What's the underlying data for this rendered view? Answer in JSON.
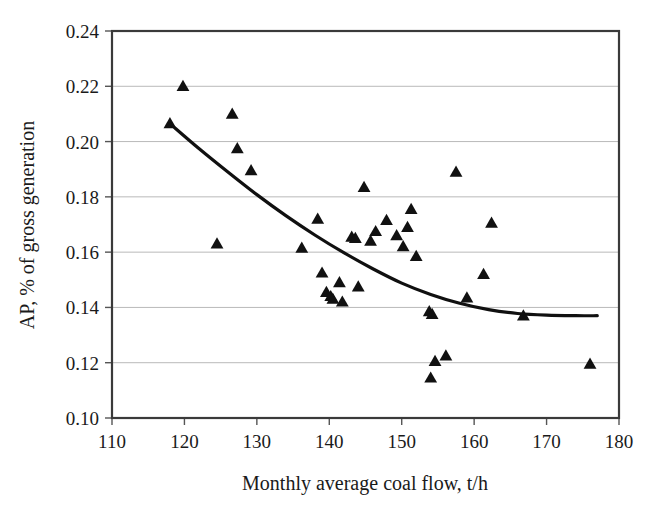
{
  "chart_data": {
    "type": "scatter",
    "title": "",
    "xlabel": "Monthly average coal flow, t/h",
    "ylabel": "AP, % of gross generation",
    "xlim": [
      110,
      180
    ],
    "ylim": [
      0.1,
      0.24
    ],
    "xticks": [
      110,
      120,
      130,
      140,
      150,
      160,
      170,
      180
    ],
    "yticks": [
      "0.10",
      "0.12",
      "0.14",
      "0.16",
      "0.18",
      "0.20",
      "0.22",
      "0.24"
    ],
    "ytick_values": [
      0.1,
      0.12,
      0.14,
      0.16,
      0.18,
      0.2,
      0.22,
      0.24
    ],
    "grid": "horizontal",
    "legend": "none",
    "marker": "triangle",
    "marker_color": "#111111",
    "series": [
      {
        "name": "Monthly observations",
        "marker": "triangle",
        "points": [
          [
            118.0,
            0.2065
          ],
          [
            119.8,
            0.22
          ],
          [
            124.5,
            0.163
          ],
          [
            126.6,
            0.21
          ],
          [
            127.3,
            0.1975
          ],
          [
            129.2,
            0.1895
          ],
          [
            136.2,
            0.1615
          ],
          [
            138.4,
            0.172
          ],
          [
            139.0,
            0.1525
          ],
          [
            139.6,
            0.1455
          ],
          [
            140.2,
            0.144
          ],
          [
            140.5,
            0.143
          ],
          [
            141.4,
            0.149
          ],
          [
            141.8,
            0.142
          ],
          [
            143.1,
            0.1655
          ],
          [
            143.6,
            0.165
          ],
          [
            144.0,
            0.1475
          ],
          [
            144.8,
            0.1835
          ],
          [
            145.7,
            0.164
          ],
          [
            146.4,
            0.1675
          ],
          [
            147.9,
            0.1715
          ],
          [
            149.3,
            0.166
          ],
          [
            150.2,
            0.162
          ],
          [
            150.8,
            0.169
          ],
          [
            151.3,
            0.1755
          ],
          [
            152.0,
            0.1585
          ],
          [
            153.8,
            0.1385
          ],
          [
            154.2,
            0.1375
          ],
          [
            154.0,
            0.1145
          ],
          [
            154.6,
            0.1205
          ],
          [
            156.1,
            0.1225
          ],
          [
            157.5,
            0.189
          ],
          [
            159.0,
            0.1435
          ],
          [
            161.3,
            0.152
          ],
          [
            162.4,
            0.1705
          ],
          [
            166.8,
            0.137
          ],
          [
            176.0,
            0.1195
          ]
        ]
      }
    ],
    "trend": {
      "name": "Fitted trend curve",
      "type": "curve",
      "points": [
        [
          118.0,
          0.2065
        ],
        [
          122.0,
          0.1975
        ],
        [
          126.0,
          0.189
        ],
        [
          130.0,
          0.1808
        ],
        [
          134.0,
          0.1732
        ],
        [
          138.0,
          0.1662
        ],
        [
          142.0,
          0.1598
        ],
        [
          146.0,
          0.154
        ],
        [
          150.0,
          0.1488
        ],
        [
          154.0,
          0.1447
        ],
        [
          158.0,
          0.1415
        ],
        [
          162.0,
          0.1392
        ],
        [
          166.0,
          0.1378
        ],
        [
          170.0,
          0.1372
        ],
        [
          174.0,
          0.137
        ],
        [
          177.0,
          0.137
        ]
      ]
    }
  }
}
